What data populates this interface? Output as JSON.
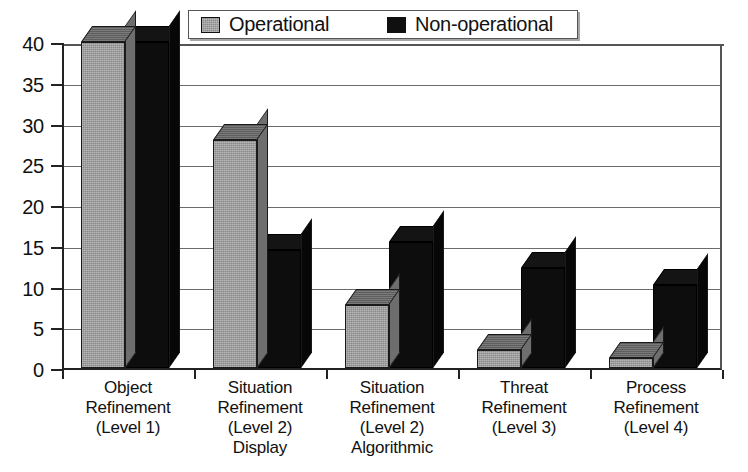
{
  "chart_data": {
    "type": "bar",
    "title": "",
    "xlabel": "",
    "ylabel": "",
    "ylim": [
      0,
      40
    ],
    "ytick_step": 5,
    "yticks": [
      40,
      35,
      30,
      25,
      20,
      15,
      10,
      5,
      0
    ],
    "grid": true,
    "legend_position": "top-center",
    "style": "3d-grouped-columns",
    "categories": [
      "Object\nRefinement\n(Level 1)",
      "Situation\nRefinement\n(Level 2)\nDisplay",
      "Situation\nRefinement\n(Level 2)\nAlgorithmic",
      "Threat\nRefinement\n(Level 3)",
      "Process\nRefinement\n(Level 4)"
    ],
    "category_lines": [
      [
        "Object",
        "Refinement",
        "(Level 1)"
      ],
      [
        "Situation",
        "Refinement",
        "(Level 2)",
        "Display"
      ],
      [
        "Situation",
        "Refinement",
        "(Level 2)",
        "Algorithmic"
      ],
      [
        "Threat",
        "Refinement",
        "(Level 3)"
      ],
      [
        "Process",
        "Refinement",
        "(Level 4)"
      ]
    ],
    "series": [
      {
        "name": "Operational",
        "color": "#8a8a8a",
        "values": [
          40,
          28,
          7.7,
          2.2,
          1.2
        ]
      },
      {
        "name": "Non-operational",
        "color": "#101010",
        "values": [
          40,
          14.5,
          15.5,
          12.3,
          10.2
        ]
      }
    ]
  },
  "legend": {
    "entries": [
      {
        "label": "Operational",
        "swatch": "gray-swatch-icon"
      },
      {
        "label": "Non-operational",
        "swatch": "black-swatch-icon"
      }
    ]
  },
  "axis": {
    "y_tick_labels": [
      "40",
      "35",
      "30",
      "25",
      "20",
      "15",
      "10",
      "5",
      "0"
    ]
  }
}
